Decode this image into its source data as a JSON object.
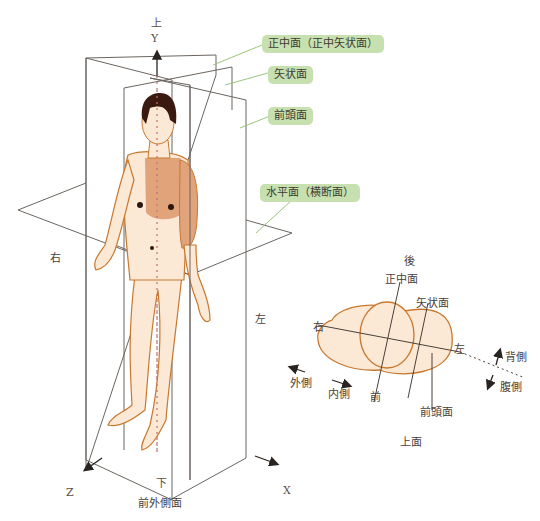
{
  "diagram": {
    "axes": {
      "y": {
        "letter": "Y",
        "direction": "上"
      },
      "z": {
        "letter": "Z"
      },
      "x": {
        "letter": "X"
      },
      "bottom": "下"
    },
    "sides": {
      "right": "右",
      "left": "左"
    },
    "plane_tags": {
      "median": "正中面（正中矢状面）",
      "sagittal": "矢状面",
      "coronal": "前頭面",
      "horizontal": "水平面（横断面）"
    },
    "front_label": "前外側面",
    "top_view": {
      "back": "後",
      "median": "正中面",
      "sagittal": "矢状面",
      "right": "右",
      "left": "左",
      "front": "前",
      "coronal": "前頭面",
      "title": "上面",
      "lateral": "外側",
      "medial": "内側",
      "dorsal": "背側",
      "ventral": "腹側"
    },
    "colors": {
      "tag_bg": "#c6e0b0",
      "skin": "#fbe9d6",
      "skin_outline": "#c8782e",
      "shaded_torso": "#e0a37a",
      "hair": "#3a1a10",
      "plane_line": "#6b6560",
      "leader_line": "#9cc47c"
    }
  }
}
